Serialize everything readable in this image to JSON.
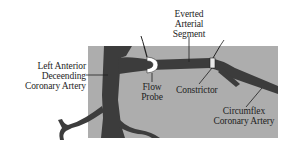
{
  "diagram": {
    "type": "anatomical-illustration",
    "colors": {
      "background": "#ffffff",
      "panel": "#a9a9a9",
      "artery": "#3c3c3c",
      "probe": "#ffffff",
      "text": "#1e1e1e",
      "leader": "#1e1e1e"
    },
    "labels": {
      "lad": {
        "lines": [
          "Left Anterior",
          "Deceending",
          "Coronary Artery"
        ]
      },
      "everted": {
        "lines": [
          "Everted",
          "Arterial",
          "Segment"
        ]
      },
      "flow_probe": {
        "lines": [
          "Flow",
          "Probe"
        ]
      },
      "constrictor": {
        "lines": [
          "Constrictor"
        ]
      },
      "circumflex": {
        "lines": [
          "Circumflex",
          "Coronary Artery"
        ]
      }
    }
  }
}
